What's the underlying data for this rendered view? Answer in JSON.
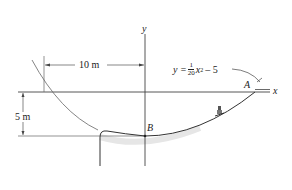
{
  "diagram": {
    "axes": {
      "x_label": "x",
      "y_label": "y"
    },
    "equation": {
      "lhs": "y =",
      "numerator": "1",
      "denominator": "20",
      "var": "x",
      "exponent": "2",
      "rest": "– 5"
    },
    "points": {
      "A": "A",
      "B": "B"
    },
    "dimensions": {
      "horizontal": "10 m",
      "vertical": "5 m"
    },
    "colors": {
      "line": "#333333",
      "curve": "#555555",
      "background": "#ffffff"
    }
  }
}
